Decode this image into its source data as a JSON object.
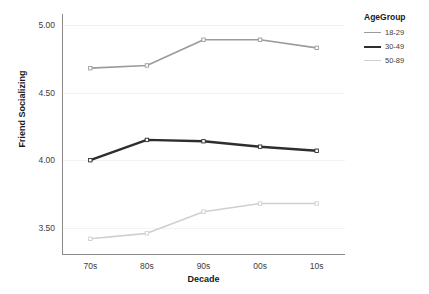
{
  "chart_data": {
    "type": "line",
    "title": "",
    "xlabel": "Decade",
    "ylabel": "Friend Socializing",
    "categories": [
      "70s",
      "80s",
      "90s",
      "00s",
      "10s"
    ],
    "ylim": [
      3.3,
      5.08
    ],
    "yticks": [
      "5.00",
      "4.50",
      "4.00",
      "3.50"
    ],
    "ytick_values": [
      5.0,
      4.5,
      4.0,
      3.5
    ],
    "grid": true,
    "legend_position": "right",
    "legend_title": "AgeGroup",
    "series": [
      {
        "name": "18-29",
        "color": "#9b9b9b",
        "width": 1.6,
        "values": [
          4.68,
          4.7,
          4.89,
          4.89,
          4.83
        ]
      },
      {
        "name": "30-49",
        "color": "#2e2e2e",
        "width": 2.4,
        "values": [
          4.0,
          4.15,
          4.14,
          4.1,
          4.07
        ]
      },
      {
        "name": "50-89",
        "color": "#cfcfcf",
        "width": 1.6,
        "values": [
          3.42,
          3.46,
          3.62,
          3.68,
          3.68
        ]
      }
    ]
  },
  "axis": {
    "y_title": "Friend Socializing",
    "x_title": "Decade"
  },
  "legend": {
    "title": "AgeGroup",
    "items": [
      {
        "label": "18-29"
      },
      {
        "label": "30-49"
      },
      {
        "label": "50-89"
      }
    ]
  },
  "colors": {
    "axis_line": "#8a8a8a",
    "gridline": "#f2f2f2",
    "tick_text": "#3d3d3d",
    "title_text": "#1a1a1a",
    "background": "#ffffff"
  }
}
